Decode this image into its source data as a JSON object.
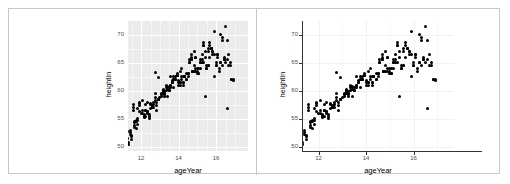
{
  "figure": {
    "layout": "two-panel-side-by-side",
    "border_color": "#c8c8c8",
    "divider_color": "#c8c8c8"
  },
  "chart_data": [
    {
      "id": "left",
      "type": "scatter",
      "title": "",
      "xlabel": "ageYear",
      "ylabel": "heightIn",
      "xlim": [
        11.3,
        17.7
      ],
      "ylim": [
        49.3,
        72.4
      ],
      "xticks": [
        12,
        14,
        16
      ],
      "yticks": [
        50,
        55,
        60,
        65,
        70
      ],
      "xtick_labels": [
        "12",
        "14",
        "16"
      ],
      "ytick_labels": [
        "50",
        "55",
        "60",
        "65",
        "70"
      ],
      "grid": true,
      "grid_color": "#ffffff",
      "panel_background": "#ebebeb",
      "theme": "grey",
      "point_color": "#000000",
      "legend": "none",
      "x": [
        11.92,
        12.92,
        12.75,
        13.42,
        15.92,
        14.25,
        15.42,
        11.58,
        14.58,
        13.92,
        12.58,
        14.83,
        15.25,
        11.67,
        15.08,
        11.75,
        15.67,
        14.08,
        12.08,
        15.58,
        13.17,
        11.83,
        16.25,
        13.58,
        12.25,
        14.92,
        15.75,
        13.25,
        11.5,
        14.42,
        12.42,
        16.08,
        13.75,
        15.33,
        12.33,
        14.17,
        16.42,
        13.08,
        11.42,
        14.67,
        15.17,
        12.67,
        13.33,
        14.75,
        16.58,
        12.17,
        13.5,
        15.5,
        14.33,
        11.33,
        16.75,
        13.67,
        12.83,
        15.83,
        14.5,
        12.5,
        16.0,
        13.0,
        11.25,
        14.0,
        15.0,
        12.0,
        13.83,
        16.33,
        14.25,
        11.58,
        15.92,
        12.75,
        13.42,
        14.92,
        16.17,
        12.33,
        13.17,
        15.58,
        14.67,
        11.92,
        16.83,
        13.58,
        12.17,
        15.33,
        14.08,
        12.92,
        16.5,
        13.75,
        11.67,
        15.17,
        14.42,
        12.58,
        13.25,
        16.67,
        15.75,
        11.83,
        14.83,
        12.25,
        13.92,
        15.42,
        16.25,
        12.42,
        14.17,
        13.5,
        11.42,
        15.08,
        16.92,
        12.67,
        14.58,
        13.08,
        15.67,
        11.75,
        16.08,
        12.83,
        14.0,
        13.67,
        15.5,
        12.08,
        16.33,
        14.33,
        11.5,
        13.33,
        15.25,
        12.5,
        16.42,
        14.75,
        13.83,
        11.25,
        15.83,
        12.75,
        14.25,
        16.58,
        13.17,
        15.0,
        12.33,
        11.92,
        14.5,
        16.75,
        13.42,
        15.58,
        12.17,
        14.08,
        13.58,
        11.67,
        16.0,
        15.33,
        12.58,
        14.92,
        13.25,
        15.92,
        11.33,
        16.17,
        12.92,
        14.67,
        13.75,
        15.17,
        12.25,
        16.67,
        14.17,
        11.83,
        13.08,
        15.42,
        12.67,
        16.25,
        14.83,
        13.33,
        11.42,
        15.67,
        12.42,
        14.33,
        13.92,
        16.5,
        15.08,
        12.08,
        11.58,
        14.42,
        13.5,
        15.75,
        12.83,
        16.33,
        14.58,
        11.75,
        13.67,
        15.5,
        12.5,
        16.83,
        14.0,
        13.17,
        11.5,
        15.25,
        12.17,
        14.75,
        16.08,
        13.83,
        15.83,
        12.75,
        11.92,
        14.25,
        13.42,
        16.42,
        15.0,
        12.33,
        14.92,
        13.58,
        11.67,
        15.58,
        16.92,
        12.92,
        14.5,
        13.25,
        15.33,
        12.25,
        16.0,
        14.08,
        11.83,
        13.75,
        15.17,
        12.58,
        14.67,
        16.58
      ],
      "y": [
        56.3,
        62.3,
        63.3,
        59.0,
        62.5,
        62.5,
        59.0,
        56.5,
        65.0,
        62.8,
        57.3,
        67.0,
        66.5,
        54.3,
        63.0,
        53.3,
        68.0,
        61.5,
        58.3,
        64.5,
        60.3,
        55.0,
        65.0,
        62.5,
        57.5,
        63.5,
        67.5,
        59.3,
        51.3,
        62.0,
        55.5,
        66.0,
        60.5,
        68.5,
        58.0,
        64.0,
        65.5,
        59.5,
        52.3,
        66.0,
        65.0,
        57.0,
        61.0,
        63.5,
        69.0,
        55.8,
        60.0,
        64.0,
        62.5,
        50.5,
        64.5,
        61.5,
        56.5,
        66.5,
        63.0,
        57.8,
        65.0,
        58.8,
        52.8,
        61.8,
        64.0,
        56.0,
        62.0,
        69.5,
        61.0,
        57.5,
        70.5,
        59.5,
        60.8,
        66.0,
        64.0,
        56.3,
        60.0,
        67.0,
        65.5,
        58.0,
        62.0,
        61.0,
        55.5,
        68.0,
        63.5,
        58.5,
        71.5,
        62.0,
        54.5,
        65.5,
        63.0,
        57.0,
        59.8,
        66.5,
        67.5,
        56.8,
        64.5,
        56.5,
        63.0,
        66.0,
        70.0,
        55.0,
        62.5,
        60.5,
        53.0,
        64.0,
        62.0,
        58.0,
        65.0,
        59.0,
        68.5,
        54.8,
        66.5,
        57.3,
        61.5,
        61.8,
        64.5,
        56.5,
        69.0,
        62.5,
        52.0,
        60.0,
        65.5,
        57.5,
        66.0,
        63.5,
        62.0,
        51.5,
        67.0,
        58.3,
        61.5,
        65.5,
        59.8,
        63.0,
        56.0,
        57.3,
        62.5,
        65.0,
        60.3,
        67.5,
        55.5,
        61.0,
        60.5,
        53.5,
        64.5,
        68.0,
        57.0,
        64.0,
        59.0,
        66.5,
        50.8,
        63.5,
        58.5,
        65.5,
        62.5,
        64.0,
        56.5,
        64.5,
        62.0,
        54.0,
        59.3,
        67.0,
        57.5,
        65.0,
        63.5,
        60.5,
        52.5,
        66.0,
        55.8,
        62.5,
        62.8,
        65.0,
        63.0,
        56.0,
        57.0,
        62.0,
        60.0,
        67.5,
        58.0,
        64.5,
        65.5,
        54.5,
        61.5,
        64.0,
        56.8,
        62.0,
        61.0,
        59.5,
        51.8,
        65.0,
        55.3,
        63.5,
        66.5,
        62.5,
        67.0,
        58.8,
        57.8,
        61.5,
        60.3,
        65.5,
        63.5,
        56.3,
        66.0,
        61.0,
        53.8,
        64.5,
        61.8,
        58.5,
        63.0,
        59.5,
        65.0,
        55.5,
        64.5,
        61.5,
        54.8,
        62.0,
        65.0,
        57.0,
        66.5,
        56.8
      ]
    },
    {
      "id": "right",
      "type": "scatter",
      "title": "",
      "xlabel": "ageYear",
      "ylabel": "heightIn",
      "xlim": [
        11.3,
        17.7
      ],
      "ylim": [
        49.3,
        72.4
      ],
      "xticks": [
        12,
        14,
        16
      ],
      "yticks": [
        50,
        55,
        60,
        65,
        70
      ],
      "xtick_labels": [
        "12",
        "14",
        "16"
      ],
      "ytick_labels": [
        "50",
        "55",
        "60",
        "65",
        "70"
      ],
      "grid": true,
      "grid_color": "#f2f2f2",
      "panel_background": "#ffffff",
      "theme": "classic-white",
      "point_color": "#000000",
      "legend": "none"
    }
  ]
}
